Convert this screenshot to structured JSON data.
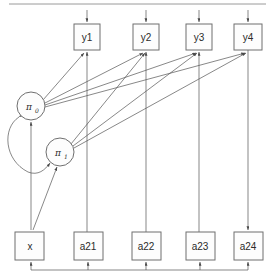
{
  "diagram": {
    "type": "path-diagram",
    "canvas": {
      "width": 274,
      "height": 276
    },
    "colors": {
      "node_stroke": "#6f6f6f",
      "node_fill": "#fdfdfd",
      "edge": "#555555",
      "label": "#2b2b2b",
      "rule": "#9a9a9a"
    },
    "observed_indicators": [
      {
        "id": "y1",
        "label": "y1",
        "x": 74,
        "y": 24,
        "w": 26,
        "h": 26
      },
      {
        "id": "y2",
        "label": "y2",
        "x": 133,
        "y": 24,
        "w": 26,
        "h": 26
      },
      {
        "id": "y3",
        "label": "y3",
        "x": 186,
        "y": 24,
        "w": 26,
        "h": 26
      },
      {
        "id": "y4",
        "label": "y4",
        "x": 234,
        "y": 24,
        "w": 28,
        "h": 26
      }
    ],
    "latent_factors": [
      {
        "id": "pi0",
        "label": "π",
        "subscript": "0",
        "cx": 31,
        "cy": 106,
        "r": 14
      },
      {
        "id": "pi1",
        "label": "π",
        "subscript": "1",
        "cx": 60,
        "cy": 152,
        "r": 14
      }
    ],
    "exogenous_variables": [
      {
        "id": "x",
        "label": "x",
        "x": 15,
        "y": 232,
        "w": 29,
        "h": 28
      },
      {
        "id": "a21",
        "label": "a21",
        "x": 74,
        "y": 232,
        "w": 29,
        "h": 28
      },
      {
        "id": "a22",
        "label": "a22",
        "x": 132,
        "y": 232,
        "w": 29,
        "h": 28
      },
      {
        "id": "a23",
        "label": "a23",
        "x": 186,
        "y": 232,
        "w": 29,
        "h": 28
      },
      {
        "id": "a24",
        "label": "a24",
        "x": 234,
        "y": 232,
        "w": 29,
        "h": 28
      }
    ],
    "edges": [
      {
        "from": "pi0",
        "to": "y1",
        "kind": "directed"
      },
      {
        "from": "pi0",
        "to": "y2",
        "kind": "directed"
      },
      {
        "from": "pi0",
        "to": "y3",
        "kind": "directed"
      },
      {
        "from": "pi0",
        "to": "y4",
        "kind": "directed"
      },
      {
        "from": "pi1",
        "to": "y2",
        "kind": "directed"
      },
      {
        "from": "pi1",
        "to": "y3",
        "kind": "directed"
      },
      {
        "from": "pi1",
        "to": "y4",
        "kind": "directed"
      },
      {
        "from": "x",
        "to": "pi0",
        "kind": "directed"
      },
      {
        "from": "x",
        "to": "pi1",
        "kind": "directed"
      },
      {
        "from": "pi0",
        "to": "pi1",
        "kind": "bidirected-curve"
      },
      {
        "from": "a21",
        "to": "y1",
        "kind": "directed"
      },
      {
        "from": "a22",
        "to": "y2",
        "kind": "directed"
      },
      {
        "from": "a23",
        "to": "y3",
        "kind": "directed"
      },
      {
        "from": "y4",
        "to": "a24",
        "kind": "directed"
      },
      {
        "from": "bottom-bus",
        "to": "x",
        "kind": "directed"
      },
      {
        "from": "bottom-bus",
        "to": "a21",
        "kind": "directed"
      },
      {
        "from": "bottom-bus",
        "to": "a22",
        "kind": "directed"
      },
      {
        "from": "bottom-bus",
        "to": "a23",
        "kind": "directed"
      },
      {
        "from": "bottom-bus",
        "to": "a24",
        "kind": "directed"
      }
    ],
    "residual_arrows": [
      {
        "target": "y1",
        "x": 87
      },
      {
        "target": "y2",
        "x": 146
      },
      {
        "target": "y3",
        "x": 199
      },
      {
        "target": "y4",
        "x": 248
      }
    ],
    "bottom_bus": {
      "y": 270,
      "x_start": 30,
      "x_end": 248
    }
  }
}
